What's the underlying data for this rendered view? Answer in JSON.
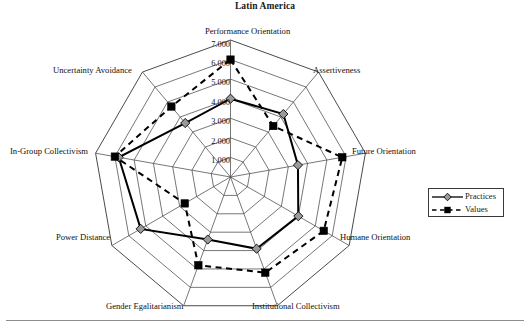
{
  "chart_data": {
    "type": "radar",
    "title": "Latin America",
    "xlabel": "",
    "ylabel": "",
    "rlim": [
      0,
      7
    ],
    "grid": true,
    "legend_position": "right",
    "tick_labels": [
      "1.000",
      "2.000",
      "3.000",
      "4.000",
      "5.000",
      "6.000",
      "7.000"
    ],
    "tick_values": [
      1,
      2,
      3,
      4,
      5,
      6,
      7
    ],
    "categories": [
      "Performance Orientation",
      "Assertiveness",
      "Future Orientation",
      "Humane Orientation",
      "Institutional Collectivism",
      "Gender Egalitarianism",
      "Power Distance",
      "In-Group Collectivism",
      "Uncertainty Avoidance"
    ],
    "series": [
      {
        "name": "Practices",
        "marker": "diamond",
        "line_style": "solid",
        "color": "#000000",
        "marker_color": "#9a9a9a",
        "values": [
          4.0,
          4.2,
          3.5,
          4.0,
          3.9,
          3.4,
          5.3,
          5.8,
          3.6
        ]
      },
      {
        "name": "Values",
        "marker": "square",
        "line_style": "dashed",
        "color": "#000000",
        "marker_color": "#000000",
        "values": [
          6.0,
          3.4,
          5.8,
          5.5,
          5.2,
          4.8,
          2.7,
          6.0,
          4.7
        ]
      }
    ]
  },
  "legend": {
    "items": [
      {
        "label": "Practices"
      },
      {
        "label": "Values"
      }
    ]
  },
  "axis_labels": {
    "performance_orientation": "Performance Orientation",
    "assertiveness": "Assertiveness",
    "future_orientation": "Future Orientation",
    "humane_orientation": "Humane Orientation",
    "institutional_collectivism": "Institutional Collectivism",
    "gender_egalitarianism": "Gender Egalitarianism",
    "power_distance": "Power Distance",
    "in_group_collectivism": "In-Group Collectivism",
    "uncertainty_avoidance": "Uncertainty Avoidance"
  },
  "ticks": {
    "t7": "7.000",
    "t6": "6.000",
    "t5": "5.000",
    "t4": "4.000",
    "t3": "3.000",
    "t2": "2.000",
    "t1": "1.000"
  }
}
